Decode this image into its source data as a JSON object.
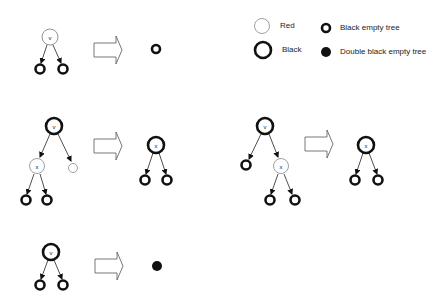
{
  "legend": {
    "red": "Red",
    "black": "Black",
    "black_empty": "Black empty tree",
    "double_black_empty": "Double black empty tree"
  },
  "nodes": {
    "v": "v",
    "x": "x"
  },
  "colors": {
    "stroke": "#111111",
    "red_stroke": "#777777",
    "arrow_stroke": "#555555",
    "background": "#ffffff"
  },
  "cases": [
    {
      "name": "case-1",
      "before": "red v with two black empty children",
      "after": "black empty tree"
    },
    {
      "name": "case-2a",
      "before": "black v with red x (two black empty children) on left and red empty on right",
      "after": "black x with two black empty children"
    },
    {
      "name": "case-2b",
      "before": "black v with black empty on left and red x (two black empty children) on right",
      "after": "black x with two black empty children"
    },
    {
      "name": "case-3",
      "before": "black v with two black empty children",
      "after": "double black empty tree"
    }
  ]
}
